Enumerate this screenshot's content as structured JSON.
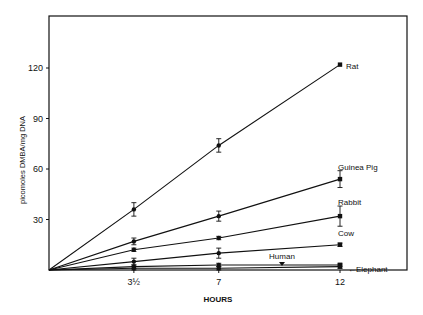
{
  "chart_data": {
    "type": "line",
    "title": "",
    "xlabel": "HOURS",
    "ylabel": "picomoles DMBA/mg DNA",
    "x": [
      0,
      3.5,
      7,
      12
    ],
    "x_tick_labels": [
      "3½",
      "7",
      "12"
    ],
    "x_ticks": [
      3.5,
      7,
      12
    ],
    "y_ticks": [
      30,
      60,
      90,
      120
    ],
    "y_tick_labels": [
      "30",
      "60",
      "90",
      "120"
    ],
    "xlim": [
      0,
      12
    ],
    "ylim": [
      0,
      120
    ],
    "grid": false,
    "legend": "inline labels at line ends",
    "series": [
      {
        "name": "Rat",
        "values": [
          0,
          36,
          74,
          122
        ],
        "errors": [
          0,
          4,
          4,
          0
        ]
      },
      {
        "name": "Guinea Pig",
        "values": [
          0,
          17,
          32,
          54
        ],
        "errors": [
          0,
          2,
          3,
          5
        ]
      },
      {
        "name": "Rabbit",
        "values": [
          0,
          12,
          19,
          32
        ],
        "errors": [
          0,
          1,
          1,
          6
        ]
      },
      {
        "name": "Cow",
        "values": [
          0,
          5,
          10,
          15
        ],
        "errors": [
          0,
          2,
          3,
          1
        ]
      },
      {
        "name": "Human",
        "values": [
          0,
          2,
          3,
          3
        ],
        "errors": [
          0,
          1,
          1,
          1
        ]
      },
      {
        "name": "Elephant",
        "values": [
          0,
          1,
          1,
          2
        ],
        "errors": [
          0,
          1,
          1,
          1
        ]
      }
    ]
  }
}
